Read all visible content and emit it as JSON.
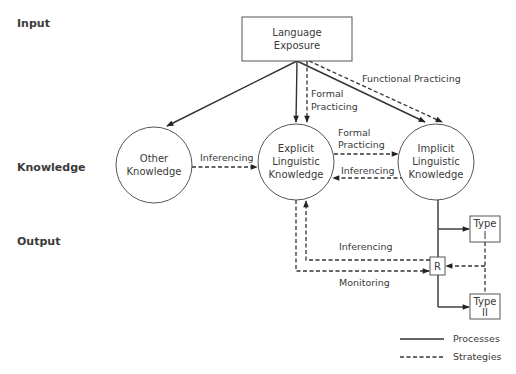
{
  "rows": {
    "input": "Input",
    "knowledge": "Knowledge",
    "output": "Output"
  },
  "nodes": {
    "language_exposure": [
      "Language",
      "Exposure"
    ],
    "other_knowledge": [
      "Other",
      "Knowledge"
    ],
    "explicit": [
      "Explicit",
      "Linguistic",
      "Knowledge"
    ],
    "implicit": [
      "Implicit",
      "Linguistic",
      "Knowledge"
    ],
    "type1": [
      "Type",
      "I"
    ],
    "type2": [
      "Type",
      "II"
    ],
    "r": "R"
  },
  "edges": {
    "functional_practicing": "Functional Practicing",
    "formal_practicing_top": [
      "Formal",
      "Practicing"
    ],
    "formal_practicing_mid": [
      "Formal",
      "Practicing"
    ],
    "inferencing_other": "Inferencing",
    "inferencing_implicit": "Inferencing",
    "inferencing_output": "Inferencing",
    "monitoring": "Monitoring"
  },
  "legend": {
    "processes": "Processes",
    "strategies": "Strategies"
  },
  "colors": {
    "line": "#333333",
    "text": "#3a3a3a",
    "background": "#ffffff"
  }
}
